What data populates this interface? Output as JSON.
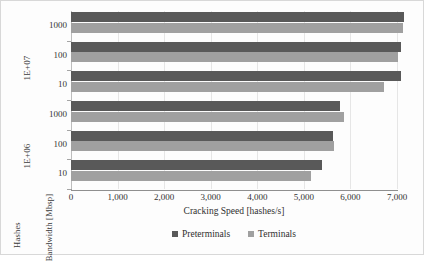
{
  "chart_data": {
    "type": "bar",
    "orientation": "horizontal",
    "title": "",
    "xlabel": "Cracking Speed [hashes/s]",
    "ylabel": "",
    "axis_group_labels": [
      "Hashes",
      "Bandwidth [Mbsp]"
    ],
    "groups": [
      {
        "name": "1E+07",
        "categories": [
          "1000",
          "100",
          "10"
        ]
      },
      {
        "name": "1E+06",
        "categories": [
          "1000",
          "100",
          "10"
        ]
      }
    ],
    "categories": [
      "1000",
      "100",
      "10",
      "1000",
      "100",
      "10"
    ],
    "series": [
      {
        "name": "Preterminals",
        "color": "#595959",
        "values": [
          7150,
          7080,
          7080,
          5780,
          5620,
          5400
        ]
      },
      {
        "name": "Terminals",
        "color": "#a0a0a0",
        "values": [
          7130,
          7020,
          6730,
          5860,
          5640,
          5160
        ]
      }
    ],
    "xlim": [
      0,
      7000
    ],
    "xticks": [
      0,
      1000,
      2000,
      3000,
      4000,
      5000,
      6000,
      7000
    ],
    "xtick_labels": [
      "0",
      "1,000",
      "2,000",
      "3,000",
      "4,000",
      "5,000",
      "6,000",
      "7,000"
    ],
    "grid": true,
    "legend_position": "bottom"
  },
  "legend": {
    "entries": [
      {
        "label": "Preterminals"
      },
      {
        "label": "Terminals"
      }
    ]
  },
  "axes": {
    "x_title": "Cracking Speed [hashes/s]",
    "group_outer_label": "Hashes",
    "group_inner_label": "Bandwidth [Mbsp]",
    "group_1": "1E+07",
    "group_2": "1E+06"
  }
}
